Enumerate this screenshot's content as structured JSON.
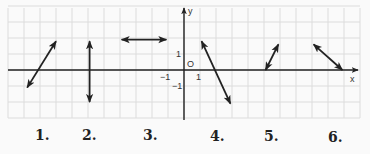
{
  "diagram": {
    "type": "coordinate-plane-line-segments",
    "axes": {
      "x_label": "x",
      "y_label": "y",
      "origin_label": "O",
      "tick_labels": {
        "x_pos": "1",
        "x_neg": "−1",
        "y_pos": "1",
        "y_neg": "−1"
      }
    },
    "grid": {
      "color": "#dcdcdc",
      "axis_color": "#222222",
      "line_color": "#222222"
    },
    "segments": [
      {
        "id": 1,
        "label": "1.",
        "from": [
          -9.8,
          -1.1
        ],
        "to": [
          -8,
          1.8
        ],
        "arrows": "both"
      },
      {
        "id": 2,
        "label": "2.",
        "from": [
          -5.9,
          1.8
        ],
        "to": [
          -5.9,
          -2
        ],
        "arrows": "both"
      },
      {
        "id": 3,
        "label": "3.",
        "from": [
          -3.9,
          1.9
        ],
        "to": [
          -1.1,
          1.9
        ],
        "arrows": "both"
      },
      {
        "id": 4,
        "label": "4.",
        "from": [
          1.1,
          1.8
        ],
        "to": [
          2.9,
          -2.1
        ],
        "arrows": "both"
      },
      {
        "id": 5,
        "label": "5.",
        "from": [
          5.1,
          0
        ],
        "to": [
          5.9,
          1.6
        ],
        "arrows": "both"
      },
      {
        "id": 6,
        "label": "6.",
        "from": [
          8.1,
          1.6
        ],
        "to": [
          9.9,
          0
        ],
        "arrows": "both"
      }
    ]
  },
  "labels": [
    "1.",
    "2.",
    "3.",
    "4.",
    "5.",
    "6."
  ]
}
